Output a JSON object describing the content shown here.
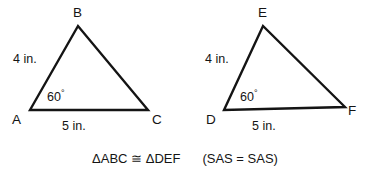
{
  "figure": {
    "background": "#ffffff",
    "stroke_color": "#141414",
    "text_color": "#141414",
    "triangles": [
      {
        "id": "triangle-abc",
        "name": "ABC",
        "vertices": [
          {
            "label": "A",
            "x": 30,
            "y": 110,
            "label_x": 12,
            "label_y": 113
          },
          {
            "label": "B",
            "x": 78,
            "y": 26,
            "label_x": 73,
            "label_y": 6
          },
          {
            "label": "C",
            "x": 148,
            "y": 110,
            "label_x": 152,
            "label_y": 113
          }
        ],
        "side_labels": [
          {
            "text": "4 in.",
            "x": 13,
            "y": 53
          },
          {
            "text": "5 in.",
            "x": 62,
            "y": 120
          }
        ],
        "angle_label": {
          "value": "60",
          "degree": "°",
          "x": 47,
          "y": 89
        }
      },
      {
        "id": "triangle-def",
        "name": "DEF",
        "vertices": [
          {
            "label": "D",
            "x": 224,
            "y": 110,
            "label_x": 206,
            "label_y": 113
          },
          {
            "label": "E",
            "x": 263,
            "y": 26,
            "label_x": 258,
            "label_y": 6
          },
          {
            "label": "F",
            "x": 345,
            "y": 107,
            "label_x": 348,
            "label_y": 104
          }
        ],
        "side_labels": [
          {
            "text": "4 in.",
            "x": 205,
            "y": 53
          },
          {
            "text": "5 in.",
            "x": 252,
            "y": 120
          }
        ],
        "angle_label": {
          "value": "60",
          "degree": "°",
          "x": 240,
          "y": 89
        }
      }
    ]
  },
  "conclusion": {
    "congruence": "ΔABC ≅ ΔDEF",
    "reason": "(SAS  =  SAS)"
  }
}
